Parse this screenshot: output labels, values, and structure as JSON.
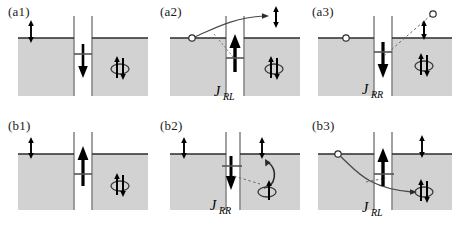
{
  "figure": {
    "type": "physics-diagram",
    "rows": 2,
    "columns": 3,
    "colors": {
      "well_fill": "#d2d2d2",
      "well_edge": "#6e6e6e",
      "fermi_line": "#2b2b2b",
      "arrow": "#000000",
      "background": "#ffffff"
    }
  },
  "panels": [
    {
      "id": "a1",
      "label": "(a1)",
      "current_label": "",
      "current_sub": "",
      "center_arrow": "down",
      "left_well_spin": "up-down-pair",
      "right_well_spin": "crossed-pair",
      "has_circle": false,
      "has_curve": false
    },
    {
      "id": "a2",
      "label": "(a2)",
      "current_label": "J",
      "current_sub": "RL",
      "center_arrow": "up",
      "left_well_spin": "",
      "right_well_spin": "crossed-pair",
      "has_circle": true,
      "has_curve": true,
      "escaped_spin": "up-down-pair"
    },
    {
      "id": "a3",
      "label": "(a3)",
      "current_label": "J",
      "current_sub": "RR",
      "center_arrow": "down",
      "left_well_spin": "",
      "right_well_spin": "crossed-pair",
      "has_circle": true,
      "has_curve": true,
      "escaped_spin": "up-down-pair"
    },
    {
      "id": "b1",
      "label": "(b1)",
      "current_label": "",
      "current_sub": "",
      "center_arrow": "up",
      "left_well_spin": "up-down-pair",
      "right_well_spin": "crossed-pair",
      "has_circle": false,
      "has_curve": false
    },
    {
      "id": "b2",
      "label": "(b2)",
      "current_label": "J",
      "current_sub": "RR",
      "center_arrow": "down",
      "left_well_spin": "up-down-pair",
      "right_well_spin": "crossed-pair",
      "has_circle": false,
      "has_curve": true
    },
    {
      "id": "b3",
      "label": "(b3)",
      "current_label": "J",
      "current_sub": "RL",
      "center_arrow": "up",
      "left_well_spin": "",
      "right_well_spin": "up-down-pair",
      "has_circle": true,
      "has_curve": true
    }
  ]
}
